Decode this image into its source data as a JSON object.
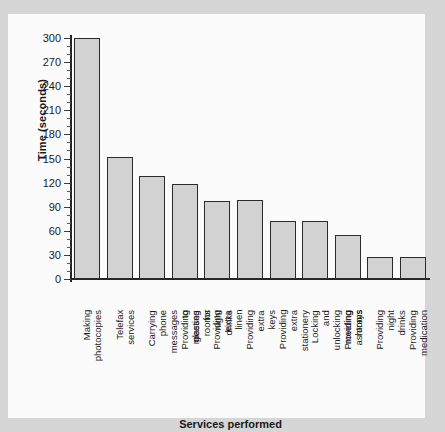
{
  "chart_data": {
    "type": "bar",
    "title": "",
    "xlabel": "Services performed",
    "ylabel": "Time (seconds)",
    "ylim": [
      0,
      300
    ],
    "ytick_step": 30,
    "yticks": [
      0,
      30,
      60,
      90,
      120,
      150,
      180,
      210,
      240,
      270,
      300
    ],
    "ytick_labels": [
      "0",
      "30",
      "60",
      "90",
      "120",
      "150",
      "180",
      "210",
      "240",
      "270",
      "300"
    ],
    "grid": false,
    "legend": null,
    "categories": [
      "Making photocopies",
      "Telefax services",
      "Carrying phone messages\nto meeting rooms",
      "Providing glasses for\nnight drinks",
      "Providing extra linen",
      "Providing extra keys",
      "Providing extra stationery",
      "Locking and unlocking\nmeeting rooms",
      "Providing ashtrays",
      "Providing night drinks",
      "Providing medication"
    ],
    "values": [
      300,
      152,
      128,
      118,
      97,
      98,
      72,
      72,
      55,
      28,
      28
    ],
    "bar_color": "#d2d2d2",
    "bar_edge_color": "#2b2b2b",
    "axis_color": "#262626",
    "plot_background": "#fbfbfb",
    "figure_background": "#d6d6d6"
  }
}
